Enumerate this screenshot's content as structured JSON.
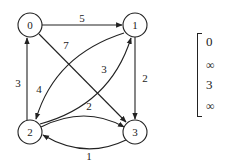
{
  "diagram": {
    "type": "weighted-directed-graph",
    "nodes": [
      {
        "id": "0",
        "label": "0",
        "x": 30,
        "y": 25
      },
      {
        "id": "1",
        "label": "1",
        "x": 135,
        "y": 25
      },
      {
        "id": "2",
        "label": "2",
        "x": 30,
        "y": 132
      },
      {
        "id": "3",
        "label": "3",
        "x": 135,
        "y": 132
      }
    ],
    "edges": [
      {
        "from": "0",
        "to": "1",
        "weight": "5"
      },
      {
        "from": "0",
        "to": "3",
        "weight": "7"
      },
      {
        "from": "1",
        "to": "2",
        "weight": "4"
      },
      {
        "from": "1",
        "to": "3",
        "weight": "2"
      },
      {
        "from": "2",
        "to": "0",
        "weight": "3"
      },
      {
        "from": "2",
        "to": "1",
        "weight": "3"
      },
      {
        "from": "2",
        "to": "3",
        "weight": "2"
      },
      {
        "from": "3",
        "to": "2",
        "weight": "1"
      }
    ]
  },
  "matrix": {
    "first_column": [
      "0",
      "∞",
      "3",
      "∞"
    ]
  }
}
